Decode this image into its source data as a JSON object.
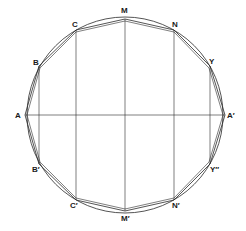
{
  "diagram": {
    "circle": {
      "cx": 125,
      "cy": 115,
      "r": 100
    },
    "colors": {
      "stroke": "#2a2a2a",
      "background": "#ffffff"
    },
    "points": {
      "M": {
        "label": "M",
        "x": 125,
        "y": 19,
        "lx": 121,
        "ly": 13
      },
      "C": {
        "label": "C",
        "x": 76,
        "y": 30,
        "lx": 72,
        "ly": 27
      },
      "N": {
        "label": "N",
        "x": 174,
        "y": 30,
        "lx": 172,
        "ly": 27
      },
      "B": {
        "label": "B",
        "x": 39,
        "y": 66,
        "lx": 33,
        "ly": 65
      },
      "Y": {
        "label": "Y",
        "x": 210,
        "y": 66,
        "lx": 209,
        "ly": 64
      },
      "A": {
        "label": "A",
        "x": 25,
        "y": 115,
        "lx": 15,
        "ly": 118
      },
      "A2": {
        "label": "A′",
        "x": 225,
        "y": 115,
        "lx": 227,
        "ly": 118
      },
      "B2": {
        "label": "B′",
        "x": 39,
        "y": 164,
        "lx": 32,
        "ly": 172
      },
      "Y2": {
        "label": "Y″",
        "x": 210,
        "y": 164,
        "lx": 210,
        "ly": 172
      },
      "C2": {
        "label": "C′",
        "x": 76,
        "y": 200,
        "lx": 70,
        "ly": 208
      },
      "N2": {
        "label": "N′",
        "x": 174,
        "y": 200,
        "lx": 172,
        "ly": 208
      },
      "M2": {
        "label": "M′",
        "x": 125,
        "y": 211,
        "lx": 121,
        "ly": 221
      }
    }
  }
}
